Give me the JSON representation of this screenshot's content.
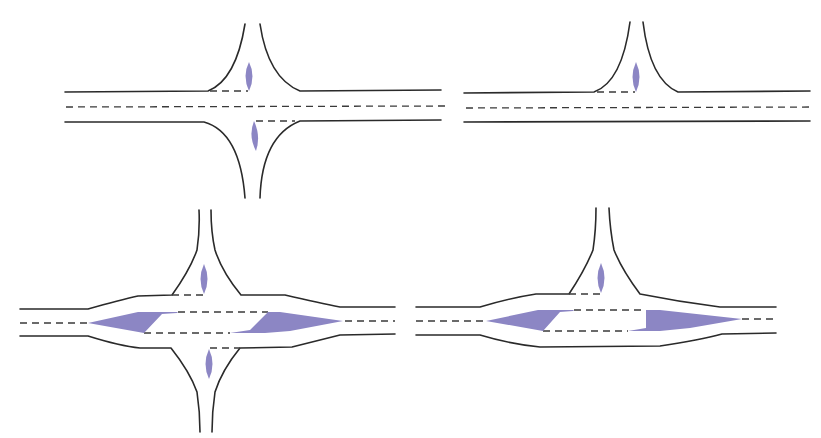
{
  "diagram": {
    "type": "road-intersection-layouts",
    "colors": {
      "background": "#ffffff",
      "road_edge": "#2a2a2a",
      "lane_marking": "#3a3a3a",
      "traffic_island": "#8c86c4"
    },
    "panels": [
      {
        "id": "panel-a",
        "position": "top-left",
        "kind": "four-leg crossroads",
        "minor_road_islands": 2,
        "major_road_islands": 0,
        "major_road_widened": false
      },
      {
        "id": "panel-b",
        "position": "top-right",
        "kind": "T-junction",
        "minor_road_islands": 1,
        "major_road_islands": 0,
        "major_road_widened": false
      },
      {
        "id": "panel-c",
        "position": "bottom-left",
        "kind": "four-leg crossroads with channelised major road",
        "minor_road_islands": 2,
        "major_road_islands": 2,
        "major_road_widened": true
      },
      {
        "id": "panel-d",
        "position": "bottom-right",
        "kind": "T-junction with channelised major road",
        "minor_road_islands": 1,
        "major_road_islands": 2,
        "major_road_widened": true
      }
    ]
  }
}
